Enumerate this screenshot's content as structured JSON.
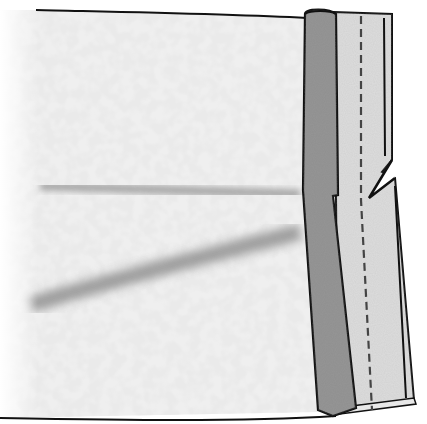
{
  "illustration": {
    "subject": "fabric panel with folded seam allowance, stitch line and notch",
    "colors": {
      "background": "#ffffff",
      "fabric_base": "#eeeeee",
      "fabric_mottle": "#d6d6d6",
      "fabric_shadow": "#a8a8a8",
      "facing_dark": "#8f8f8f",
      "facing_light": "#dcdcdc",
      "outline": "#111111",
      "stitch": "#444444"
    },
    "parts": [
      "fabric-body",
      "fold-shadow-upper",
      "fold-shadow-lower",
      "dark-facing-strip",
      "light-seam-strip",
      "stitch-line",
      "notch"
    ]
  }
}
